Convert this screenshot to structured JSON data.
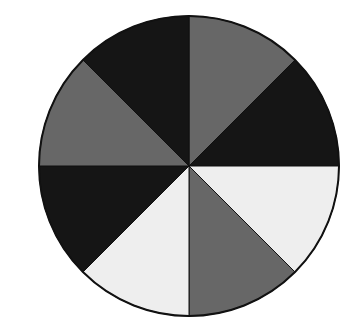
{
  "figure": {
    "type": "divided-circle",
    "center": [
      189,
      166
    ],
    "radius": 150,
    "outline_color": "#111111",
    "slice_count": 8,
    "start_angle_deg": 0,
    "direction": "clockwise-from-top",
    "colors": {
      "dark": "#151515",
      "mid": "#676767",
      "light": "#eeeeee"
    },
    "slices": [
      {
        "index": 0,
        "from_deg": 0,
        "to_deg": 45,
        "shade": "mid"
      },
      {
        "index": 1,
        "from_deg": 45,
        "to_deg": 90,
        "shade": "dark"
      },
      {
        "index": 2,
        "from_deg": 90,
        "to_deg": 135,
        "shade": "light"
      },
      {
        "index": 3,
        "from_deg": 135,
        "to_deg": 180,
        "shade": "mid"
      },
      {
        "index": 4,
        "from_deg": 180,
        "to_deg": 225,
        "shade": "light"
      },
      {
        "index": 5,
        "from_deg": 225,
        "to_deg": 270,
        "shade": "dark"
      },
      {
        "index": 6,
        "from_deg": 270,
        "to_deg": 315,
        "shade": "mid"
      },
      {
        "index": 7,
        "from_deg": 315,
        "to_deg": 360,
        "shade": "dark"
      }
    ]
  }
}
